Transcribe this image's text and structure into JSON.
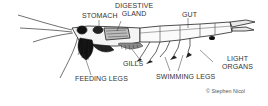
{
  "diagram": {
    "labels": {
      "stomach": "STOMACH",
      "digestive_gland_line1": "DIGESTIVE",
      "digestive_gland_line2": "GLAND",
      "gut": "GUT",
      "feeding_legs": "FEEDING LEGS",
      "gills": "GILLS",
      "swimming_legs": "SWIMMING LEGS",
      "light_organs_line1": "LIGHT",
      "light_organs_line2": "ORGANS"
    },
    "credit": "© Stephen Nicol",
    "colors": {
      "background": "#ffffff",
      "ink": "#222222",
      "label": "#333333"
    }
  }
}
